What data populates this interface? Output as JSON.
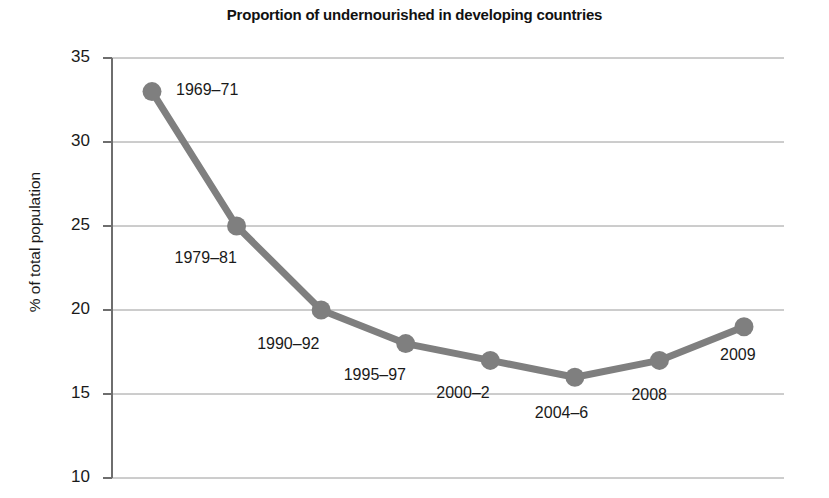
{
  "chart_data": {
    "type": "line",
    "title": "Proportion of undernourished in developing countries",
    "xlabel": "",
    "ylabel": "% of total population",
    "categories": [
      "1969–71",
      "1979–81",
      "1990–92",
      "1995–97",
      "2000–2",
      "2004–6",
      "2008",
      "2009"
    ],
    "values": [
      33,
      25,
      20,
      18,
      17,
      16,
      17,
      19
    ],
    "series": [
      {
        "name": "% of total population undernourished",
        "values": [
          33,
          25,
          20,
          18,
          17,
          16,
          17,
          19
        ]
      }
    ],
    "ylim": [
      10,
      35
    ],
    "yticks": [
      35,
      30,
      25,
      20,
      15,
      10
    ],
    "ytick_labels": [
      "35",
      "30",
      "25",
      "20",
      "15",
      "10"
    ],
    "xticks": [],
    "xtick_labels": [],
    "grid": "horizontal",
    "legend": "none",
    "point_labels": [
      {
        "text": "1969–71",
        "anchor_value": 33,
        "placement": "right"
      },
      {
        "text": "1979–81",
        "anchor_value": 25,
        "placement": "below-left"
      },
      {
        "text": "1990–92",
        "anchor_value": 20,
        "placement": "below-left"
      },
      {
        "text": "1995–97",
        "anchor_value": 18,
        "placement": "below-left"
      },
      {
        "text": "2000–2",
        "anchor_value": 17,
        "placement": "below-left"
      },
      {
        "text": "2004–6",
        "anchor_value": 16,
        "placement": "below"
      },
      {
        "text": "2008",
        "anchor_value": 17,
        "placement": "below"
      },
      {
        "text": "2009",
        "anchor_value": 19,
        "placement": "below-right"
      }
    ],
    "colors": {
      "line": "#7f7f7f",
      "marker": "#7f7f7f",
      "grid": "#9a9a9a",
      "axis": "#6e6e6e",
      "text": "#1a1a1a",
      "background": "#ffffff"
    }
  },
  "axis": {
    "y_label": "% of total population",
    "y_ticks": [
      "35",
      "30",
      "25",
      "20",
      "15",
      "10"
    ]
  },
  "title": {
    "text": "Proportion of undernourished in developing countries"
  }
}
